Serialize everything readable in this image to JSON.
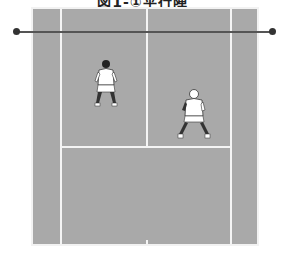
{
  "figure": {
    "title": "図1-①平行陣",
    "court_color": "#a9a9a9",
    "line_color": "#f4f4f4",
    "net_color": "#555555",
    "players": [
      {
        "id": "player-1",
        "position": "left service court, near net"
      },
      {
        "id": "player-2",
        "position": "right service court, behind player 1"
      }
    ]
  }
}
